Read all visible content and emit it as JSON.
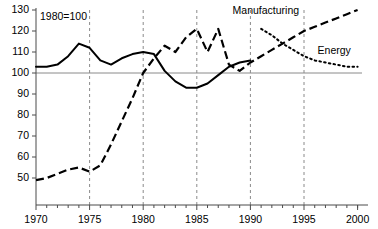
{
  "chart_data": {
    "type": "line",
    "title": "",
    "note": "1980=100",
    "xlabel": "",
    "ylabel": "",
    "xlim": [
      1970,
      2001
    ],
    "ylim": [
      44,
      132
    ],
    "yticks": [
      50,
      60,
      70,
      80,
      90,
      100,
      110,
      120,
      130
    ],
    "ytick_labels": [
      "50",
      "60",
      "70",
      "80",
      "90",
      "100",
      "110",
      "120",
      "130"
    ],
    "xticks": [
      1970,
      1975,
      1980,
      1985,
      1990,
      1995,
      2000
    ],
    "xtick_labels": [
      "1970",
      "1975",
      "1980",
      "1985",
      "1990",
      "1995",
      "2000"
    ],
    "xminor_ticks": [
      1971,
      1972,
      1973,
      1974,
      1976,
      1977,
      1978,
      1979,
      1981,
      1982,
      1983,
      1984,
      1986,
      1987,
      1988,
      1989,
      1991,
      1992,
      1993,
      1994,
      1996,
      1997,
      1998,
      1999,
      2000
    ],
    "grid": "vertical-dashed",
    "gridlines_x": [
      1975,
      1980,
      1985,
      1990,
      1995
    ],
    "reference_line_y": 100,
    "legend_position": "inline-annotations",
    "series": [
      {
        "name": "Energy",
        "label": "Energy",
        "style": "solid-then-dotted",
        "label_x": 2000,
        "label_y": 109,
        "x": [
          1970,
          1971,
          1972,
          1973,
          1974,
          1975,
          1976,
          1977,
          1978,
          1979,
          1980,
          1981,
          1982,
          1983,
          1984,
          1985,
          1986,
          1987,
          1988,
          1989,
          1990,
          1991,
          1992,
          1993,
          1994,
          1995,
          1996,
          1997,
          1998,
          1999,
          2000
        ],
        "values": [
          103,
          103,
          104,
          108,
          114,
          112,
          106,
          104,
          107,
          109,
          110,
          109,
          101,
          96,
          93,
          93,
          95,
          99,
          103,
          105,
          106,
          121,
          118,
          114,
          111,
          108,
          106,
          105,
          104,
          103,
          103
        ],
        "solid_until": 1990,
        "dotted_from": 1985
      },
      {
        "name": "Manufacturing",
        "label": "Manufacturing",
        "style": "dashed",
        "label_x": 1993,
        "label_y": 128,
        "x": [
          1970,
          1971,
          1972,
          1973,
          1974,
          1975,
          1976,
          1977,
          1978,
          1979,
          1980,
          1981,
          1982,
          1983,
          1984,
          1985,
          1986,
          1987,
          1988,
          1989,
          1990,
          1991,
          1992,
          1993,
          1994,
          1995,
          1996,
          1997,
          1998,
          1999,
          2000
        ],
        "values": [
          49,
          50,
          52,
          54,
          55,
          53,
          56,
          66,
          77,
          88,
          100,
          107,
          113,
          110,
          117,
          121,
          110,
          121,
          104,
          101,
          105,
          108,
          111,
          114,
          117,
          120,
          122,
          124,
          126,
          128,
          130
        ]
      }
    ]
  },
  "axis": {
    "y_axis_name": "index-axis",
    "x_axis_name": "year-axis"
  }
}
